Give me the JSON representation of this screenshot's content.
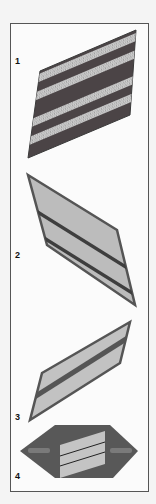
{
  "figure": {
    "items": [
      {
        "number": "1",
        "name": "insignia-chevron-striped"
      },
      {
        "number": "2",
        "name": "insignia-two-stripe"
      },
      {
        "number": "3",
        "name": "insignia-single-stripe"
      },
      {
        "number": "4",
        "name": "insignia-hexagon-tab"
      }
    ]
  },
  "colors": {
    "frame_border": "#555555",
    "patch_dark": "#4a4a4a",
    "patch_light": "#b8b8b8",
    "stripe_gold": "#c9c9c9",
    "stripe_dark": "#3c3c3c"
  }
}
